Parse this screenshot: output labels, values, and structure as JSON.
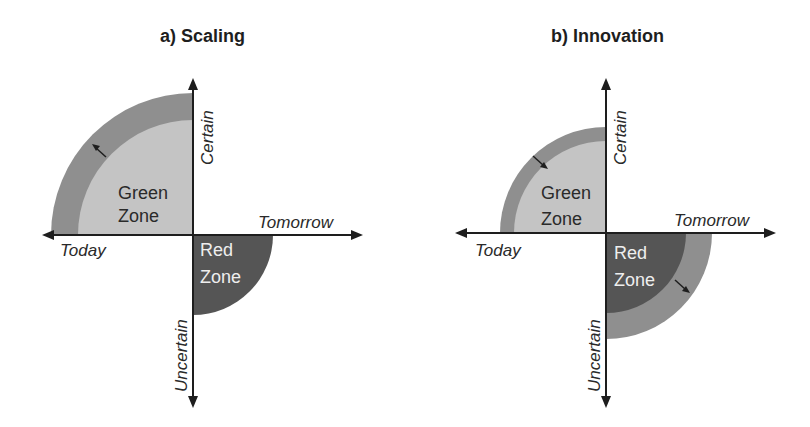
{
  "figure": {
    "colors": {
      "outer_ring": "#8f8f8f",
      "green_zone": "#c4c4c4",
      "red_zone": "#555555",
      "axis": "#1e1e1e",
      "text_dark": "#2a2a2a",
      "text_light": "#eeeeee"
    },
    "axis_labels": {
      "up": "Certain",
      "down": "Uncertain",
      "left": "Today",
      "right": "Tomorrow"
    },
    "panels": [
      {
        "title": "a) Scaling",
        "green_zone_label": [
          "Green",
          "Zone"
        ],
        "red_zone_label": [
          "Red",
          "Zone"
        ],
        "green_outer_radius": 142,
        "green_inner_radius": 115,
        "red_radius": 80,
        "arrow": "outward from green zone"
      },
      {
        "title": "b) Innovation",
        "green_zone_label": [
          "Green",
          "Zone"
        ],
        "red_zone_label": [
          "Red",
          "Zone"
        ],
        "green_outer_radius": 106,
        "green_inner_radius": 92,
        "red_inner_radius": 80,
        "red_outer_radius": 106,
        "arrows": [
          "inward into green zone",
          "outward from red zone"
        ]
      }
    ]
  }
}
